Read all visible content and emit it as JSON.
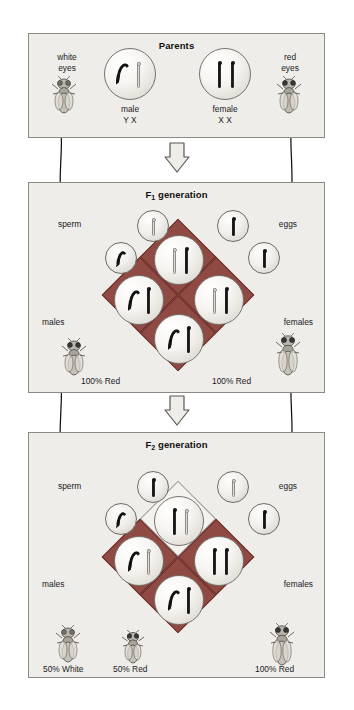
{
  "figure": {
    "type": "genetics-punnett-cross"
  },
  "panels": {
    "parents": {
      "title": "Parents",
      "left_label": "white\neyes",
      "right_label": "red\neyes",
      "male_label": "male",
      "male_genotype": "Y X",
      "female_label": "female",
      "female_genotype": "X X",
      "male_chromosomes": [
        "Y-dark-hook",
        "X-light"
      ],
      "female_chromosomes": [
        "X-dark",
        "X-dark"
      ]
    },
    "f1": {
      "title": "F",
      "title_sub": "1",
      "title_rest": " generation",
      "sperm_label": "sperm",
      "eggs_label": "eggs",
      "males_label": "males",
      "females_label": "females",
      "males_result": "100% Red",
      "females_result": "100% Red",
      "sperm_gametes": [
        "X-light",
        "Y-dark-hook"
      ],
      "egg_gametes": [
        "X-dark",
        "X-dark"
      ],
      "squares": [
        {
          "position": "top",
          "fill": "red",
          "chromosomes": [
            "X-light",
            "X-dark"
          ]
        },
        {
          "position": "left",
          "fill": "red",
          "chromosomes": [
            "Y-dark-hook",
            "X-dark"
          ]
        },
        {
          "position": "right",
          "fill": "red",
          "chromosomes": [
            "X-light",
            "X-dark"
          ]
        },
        {
          "position": "bottom",
          "fill": "red",
          "chromosomes": [
            "Y-dark-hook",
            "X-dark"
          ]
        }
      ]
    },
    "f2": {
      "title": "F",
      "title_sub": "2",
      "title_rest": " generation",
      "sperm_label": "sperm",
      "eggs_label": "eggs",
      "males_label": "males",
      "females_label": "females",
      "results": [
        "50% White",
        "50% Red",
        "100% Red"
      ],
      "sperm_gametes": [
        "X-dark",
        "Y-dark-hook"
      ],
      "egg_gametes": [
        "X-light",
        "X-dark"
      ],
      "squares": [
        {
          "position": "top",
          "fill": "red",
          "chromosomes": [
            "X-dark",
            "X-light"
          ]
        },
        {
          "position": "left",
          "fill": "white",
          "chromosomes": [
            "Y-dark-hook",
            "X-light"
          ]
        },
        {
          "position": "right",
          "fill": "red",
          "chromosomes": [
            "X-dark",
            "X-dark"
          ]
        },
        {
          "position": "bottom",
          "fill": "red",
          "chromosomes": [
            "Y-dark-hook",
            "X-dark"
          ]
        }
      ]
    }
  },
  "colors": {
    "panel_background": "#efedea",
    "panel_border": "#8d8a85",
    "red_square": "#8f4a43",
    "white_square": "#f4f2ef",
    "chromosome_dark": "#121212",
    "chromosome_light": "#e3e1dc",
    "text": "#1a1a1a"
  },
  "icons": {
    "flow_arrow": "down-block-arrow",
    "connector": "curved-arrow"
  }
}
